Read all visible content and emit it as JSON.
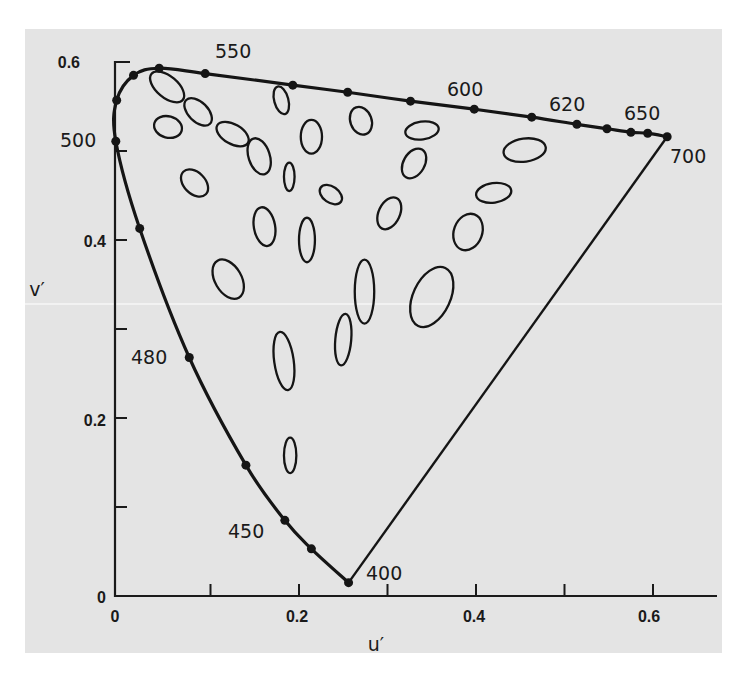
{
  "chart_data": {
    "type": "scatter",
    "title": "",
    "subtitle": "CIE 1976 u'v' chromaticity diagram with MacAdam discrimination ellipses",
    "xlabel": "u′",
    "ylabel": "v′",
    "xlim": [
      0,
      0.68
    ],
    "ylim": [
      0,
      0.6
    ],
    "xticks": [
      0,
      0.1,
      0.2,
      0.3,
      0.4,
      0.5,
      0.6
    ],
    "xtick_labels": [
      "0",
      "",
      "0.2",
      "",
      "0.4",
      "",
      "0.6"
    ],
    "yticks": [
      0,
      0.1,
      0.2,
      0.3,
      0.4,
      0.5,
      0.6
    ],
    "ytick_labels": [
      "0",
      "",
      "0.2",
      "",
      "0.4",
      "",
      "0.6"
    ],
    "grid": false,
    "legend": null,
    "spectral_locus": {
      "points_uv": [
        [
          0.256,
          0.015
        ],
        [
          0.214,
          0.053
        ],
        [
          0.184,
          0.085
        ],
        [
          0.14,
          0.147
        ],
        [
          0.076,
          0.268
        ],
        [
          0.02,
          0.413
        ],
        [
          -0.007,
          0.511
        ],
        [
          -0.006,
          0.557
        ],
        [
          0.013,
          0.585
        ],
        [
          0.042,
          0.593
        ],
        [
          0.094,
          0.587
        ],
        [
          0.193,
          0.574
        ],
        [
          0.255,
          0.566
        ],
        [
          0.326,
          0.556
        ],
        [
          0.398,
          0.547
        ],
        [
          0.463,
          0.538
        ],
        [
          0.514,
          0.53
        ],
        [
          0.548,
          0.525
        ],
        [
          0.575,
          0.521
        ],
        [
          0.594,
          0.52
        ],
        [
          0.616,
          0.516
        ]
      ],
      "closing_line": [
        [
          0.616,
          0.516
        ],
        [
          0.256,
          0.015
        ]
      ]
    },
    "wavelength_labels": [
      {
        "nm": "400",
        "u": 0.256,
        "v": 0.015
      },
      {
        "nm": "450",
        "u": 0.184,
        "v": 0.085
      },
      {
        "nm": "480",
        "u": 0.076,
        "v": 0.268
      },
      {
        "nm": "500",
        "u": -0.007,
        "v": 0.511
      },
      {
        "nm": "550",
        "u": 0.094,
        "v": 0.587
      },
      {
        "nm": "600",
        "u": 0.398,
        "v": 0.547
      },
      {
        "nm": "620",
        "u": 0.463,
        "v": 0.538
      },
      {
        "nm": "650",
        "u": 0.594,
        "v": 0.52
      },
      {
        "nm": "700",
        "u": 0.616,
        "v": 0.516
      }
    ],
    "ellipses_uv": [
      {
        "u": 0.051,
        "v": 0.572,
        "ru": 0.023,
        "rv": 0.012,
        "rot": 40
      },
      {
        "u": 0.086,
        "v": 0.544,
        "ru": 0.019,
        "rv": 0.011,
        "rot": 45
      },
      {
        "u": 0.052,
        "v": 0.527,
        "ru": 0.016,
        "rv": 0.012,
        "rot": 15
      },
      {
        "u": 0.125,
        "v": 0.519,
        "ru": 0.02,
        "rv": 0.011,
        "rot": 30
      },
      {
        "u": 0.155,
        "v": 0.494,
        "ru": 0.012,
        "rv": 0.021,
        "rot": -18
      },
      {
        "u": 0.18,
        "v": 0.557,
        "ru": 0.008,
        "rv": 0.016,
        "rot": -15
      },
      {
        "u": 0.214,
        "v": 0.516,
        "ru": 0.012,
        "rv": 0.019,
        "rot": 0
      },
      {
        "u": 0.082,
        "v": 0.464,
        "ru": 0.018,
        "rv": 0.012,
        "rot": 45
      },
      {
        "u": 0.189,
        "v": 0.471,
        "ru": 0.006,
        "rv": 0.016,
        "rot": 0
      },
      {
        "u": 0.236,
        "v": 0.451,
        "ru": 0.014,
        "rv": 0.009,
        "rot": 35
      },
      {
        "u": 0.161,
        "v": 0.415,
        "ru": 0.012,
        "rv": 0.022,
        "rot": -10
      },
      {
        "u": 0.209,
        "v": 0.4,
        "ru": 0.009,
        "rv": 0.025,
        "rot": 0
      },
      {
        "u": 0.27,
        "v": 0.534,
        "ru": 0.012,
        "rv": 0.016,
        "rot": -20
      },
      {
        "u": 0.339,
        "v": 0.523,
        "ru": 0.019,
        "rv": 0.01,
        "rot": -8
      },
      {
        "u": 0.33,
        "v": 0.486,
        "ru": 0.012,
        "rv": 0.018,
        "rot": 30
      },
      {
        "u": 0.455,
        "v": 0.501,
        "ru": 0.024,
        "rv": 0.013,
        "rot": -8
      },
      {
        "u": 0.302,
        "v": 0.43,
        "ru": 0.012,
        "rv": 0.019,
        "rot": 25
      },
      {
        "u": 0.42,
        "v": 0.453,
        "ru": 0.02,
        "rv": 0.011,
        "rot": -8
      },
      {
        "u": 0.391,
        "v": 0.409,
        "ru": 0.016,
        "rv": 0.021,
        "rot": 20
      },
      {
        "u": 0.274,
        "v": 0.342,
        "ru": 0.011,
        "rv": 0.036,
        "rot": 0
      },
      {
        "u": 0.35,
        "v": 0.336,
        "ru": 0.021,
        "rv": 0.036,
        "rot": 25
      },
      {
        "u": 0.12,
        "v": 0.356,
        "ru": 0.015,
        "rv": 0.024,
        "rot": -30
      },
      {
        "u": 0.183,
        "v": 0.264,
        "ru": 0.011,
        "rv": 0.033,
        "rot": -8
      },
      {
        "u": 0.25,
        "v": 0.288,
        "ru": 0.009,
        "rv": 0.029,
        "rot": 5
      },
      {
        "u": 0.19,
        "v": 0.158,
        "ru": 0.007,
        "rv": 0.02,
        "rot": 0
      }
    ]
  },
  "axes": {
    "x_label": "u′",
    "y_label": "v′",
    "x_tick_labels": [
      "0",
      "0.2",
      "0.4",
      "0.6"
    ],
    "y_tick_labels": [
      "0",
      "0.2",
      "0.4",
      "0.6"
    ]
  },
  "wavelengths": {
    "w400": "400",
    "w450": "450",
    "w480": "480",
    "w500": "500",
    "w550": "550",
    "w600": "600",
    "w620": "620",
    "w650": "650",
    "w700": "700"
  },
  "colors": {
    "background": "#e4e4e4",
    "ink": "#151515"
  }
}
